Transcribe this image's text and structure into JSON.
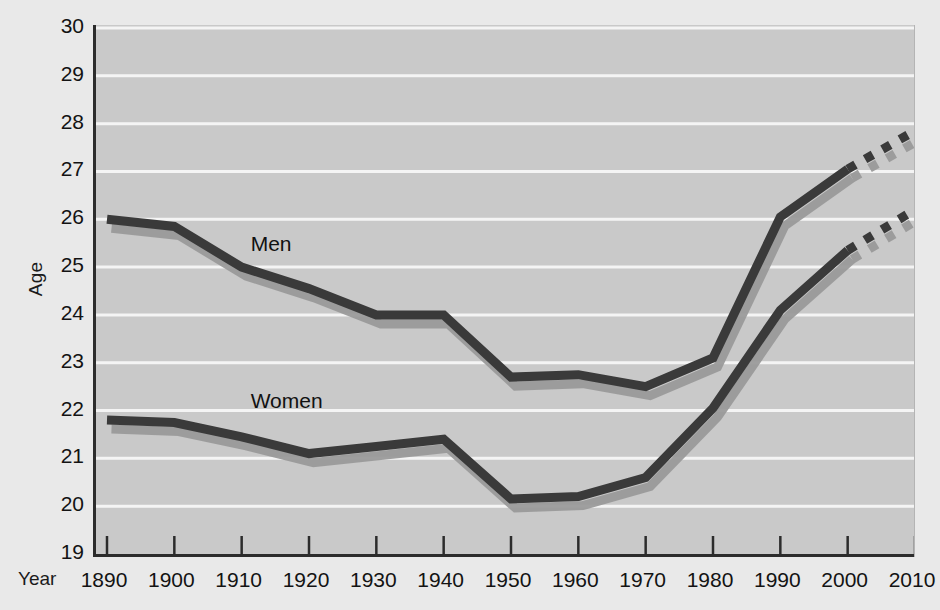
{
  "chart_data": {
    "type": "line",
    "title": "",
    "xlabel": "Year",
    "ylabel": "Age",
    "xlim": [
      1890,
      2010
    ],
    "ylim": [
      19,
      30
    ],
    "grid": true,
    "legend": "inline-labels",
    "x": [
      1890,
      1900,
      1910,
      1920,
      1930,
      1940,
      1950,
      1960,
      1970,
      1980,
      1990,
      2000,
      2010
    ],
    "xticks": [
      "1890",
      "1900",
      "1910",
      "1920",
      "1930",
      "1940",
      "1950",
      "1960",
      "1970",
      "1980",
      "1990",
      "2000",
      "2010"
    ],
    "yticks": [
      "19",
      "20",
      "21",
      "22",
      "23",
      "24",
      "25",
      "26",
      "27",
      "28",
      "29",
      "30"
    ],
    "projection_starts_at": 2000,
    "series": [
      {
        "name": "Men",
        "color": "#3a3a3a",
        "shadow_color": "#9a9a9a",
        "label_x": 1910,
        "label_y": 25.45,
        "values": [
          26.0,
          25.85,
          25.0,
          24.55,
          24.0,
          24.0,
          22.7,
          22.75,
          22.5,
          23.1,
          26.05,
          27.05,
          27.85
        ],
        "solid_until": 2000,
        "dashed_from": 2000
      },
      {
        "name": "Women",
        "color": "#3a3a3a",
        "shadow_color": "#9a9a9a",
        "label_x": 1910,
        "label_y": 22.15,
        "values": [
          21.8,
          21.75,
          21.45,
          21.1,
          21.25,
          21.4,
          20.15,
          20.2,
          20.6,
          22.05,
          24.1,
          25.35,
          26.2
        ],
        "solid_until": 2000,
        "dashed_from": 2000
      }
    ]
  },
  "axes": {
    "ylabel": "Age",
    "xlabel": "Year"
  }
}
